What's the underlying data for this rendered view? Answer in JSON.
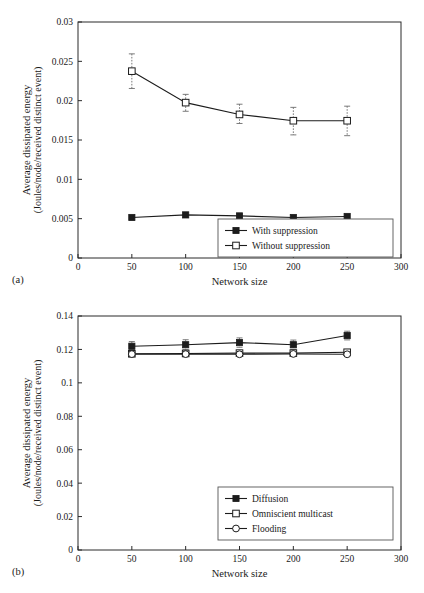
{
  "figure": {
    "panel_a_caption": "(a)",
    "panel_b_caption": "(b)"
  },
  "chart_data": [
    {
      "id": "panel-a",
      "type": "line",
      "title": "",
      "xlabel": "Network size",
      "ylabel": "Average dissipated energy",
      "ylabel_sub": "(Joules/node/received distinct event)",
      "x": [
        50,
        100,
        150,
        200,
        250
      ],
      "xlim": [
        0,
        300
      ],
      "ylim": [
        0,
        0.03
      ],
      "xticks": [
        0,
        50,
        100,
        150,
        200,
        250,
        300
      ],
      "xticklabels": [
        "0",
        "50",
        "100",
        "150",
        "200",
        "250",
        "300"
      ],
      "yticks": [
        0,
        0.005,
        0.01,
        0.015,
        0.02,
        0.025,
        0.03
      ],
      "yticklabels": [
        "0",
        "0.005",
        "0.01",
        "0.015",
        "0.02",
        "0.025",
        "0.03"
      ],
      "grid": false,
      "legend_position": "lower-right",
      "series": [
        {
          "name": "With suppression",
          "marker": "filled-square",
          "values": [
            0.00515,
            0.00548,
            0.00535,
            0.00515,
            0.00528
          ],
          "err_low": [
            0.0,
            0.0,
            0.0,
            0.0,
            0.0
          ],
          "err_high": [
            0.0,
            0.0,
            0.0,
            0.0,
            0.0
          ]
        },
        {
          "name": "Without suppression",
          "marker": "open-square",
          "values": [
            0.02375,
            0.01975,
            0.01825,
            0.01745,
            0.01745
          ],
          "err_low": [
            0.0022,
            0.0011,
            0.00115,
            0.0018,
            0.0019
          ],
          "err_high": [
            0.0022,
            0.00105,
            0.0013,
            0.0017,
            0.00185
          ]
        }
      ]
    },
    {
      "id": "panel-b",
      "type": "line",
      "title": "",
      "xlabel": "Network size",
      "ylabel": "Average dissipated energy",
      "ylabel_sub": "(Joules/node/received distinct event)",
      "x": [
        50,
        100,
        150,
        200,
        250
      ],
      "xlim": [
        0,
        300
      ],
      "ylim": [
        0,
        0.14
      ],
      "xticks": [
        0,
        50,
        100,
        150,
        200,
        250,
        300
      ],
      "xticklabels": [
        "0",
        "50",
        "100",
        "150",
        "200",
        "250",
        "300"
      ],
      "yticks": [
        0,
        0.02,
        0.04,
        0.06,
        0.08,
        0.1,
        0.12,
        0.14
      ],
      "yticklabels": [
        "0",
        "0.02",
        "0.04",
        "0.06",
        "0.08",
        "0.1",
        "0.12",
        "0.14"
      ],
      "grid": false,
      "legend_position": "lower-right",
      "series": [
        {
          "name": "Diffusion",
          "marker": "filled-square",
          "values": [
            0.1219,
            0.1228,
            0.1241,
            0.1228,
            0.1283
          ],
          "err_low": [
            0.0028,
            0.003,
            0.0028,
            0.0028,
            0.0026
          ],
          "err_high": [
            0.0028,
            0.003,
            0.0028,
            0.0028,
            0.0026
          ]
        },
        {
          "name": "Omniscient multicast",
          "marker": "open-square",
          "values": [
            0.1174,
            0.1176,
            0.1178,
            0.1178,
            0.1183
          ],
          "err_low": [
            0.0009,
            0.0009,
            0.0009,
            0.0009,
            0.0009
          ],
          "err_high": [
            0.0009,
            0.0009,
            0.0009,
            0.0009,
            0.0009
          ]
        },
        {
          "name": "Flooding",
          "marker": "open-circle",
          "values": [
            0.1172,
            0.1172,
            0.1171,
            0.1173,
            0.1171
          ],
          "err_low": [
            0.0008,
            0.0008,
            0.0008,
            0.0008,
            0.0008
          ],
          "err_high": [
            0.0008,
            0.0008,
            0.0008,
            0.0008,
            0.0008
          ]
        }
      ]
    }
  ]
}
